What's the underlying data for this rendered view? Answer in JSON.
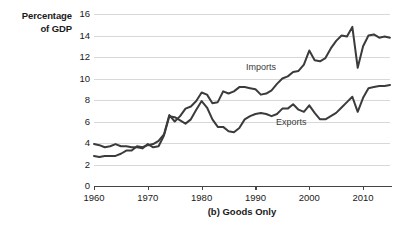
{
  "chart_data": {
    "type": "line",
    "title": "(b) Goods Only",
    "ylabel_line1": "Percentage",
    "ylabel_line2": "of GDP",
    "xlabel": "",
    "xlim": [
      1960,
      2015
    ],
    "ylim": [
      0,
      16
    ],
    "yticks": [
      0,
      2,
      4,
      6,
      8,
      10,
      12,
      14,
      16
    ],
    "xticks": [
      1960,
      1970,
      1980,
      1990,
      2000,
      2010
    ],
    "grid": true,
    "legend_position": "inline-annotation",
    "line_color": "#3b3b3b",
    "grid_color": "#d8d8d8",
    "x": [
      1960,
      1961,
      1962,
      1963,
      1964,
      1965,
      1966,
      1967,
      1968,
      1969,
      1970,
      1971,
      1972,
      1973,
      1974,
      1975,
      1976,
      1977,
      1978,
      1979,
      1980,
      1981,
      1982,
      1983,
      1984,
      1985,
      1986,
      1987,
      1988,
      1989,
      1990,
      1991,
      1992,
      1993,
      1994,
      1995,
      1996,
      1997,
      1998,
      1999,
      2000,
      2001,
      2002,
      2003,
      2004,
      2005,
      2006,
      2007,
      2008,
      2009,
      2010,
      2011,
      2012,
      2013,
      2014,
      2015
    ],
    "series": [
      {
        "name": "Imports",
        "label": "Imports",
        "values": [
          2.8,
          2.7,
          2.8,
          2.8,
          2.8,
          3.0,
          3.3,
          3.3,
          3.7,
          3.6,
          3.8,
          3.9,
          4.2,
          4.8,
          6.6,
          6.0,
          6.5,
          7.2,
          7.4,
          7.9,
          8.7,
          8.5,
          7.7,
          7.8,
          8.8,
          8.6,
          8.8,
          9.2,
          9.2,
          9.1,
          9.0,
          8.5,
          8.6,
          8.9,
          9.5,
          10.0,
          10.2,
          10.6,
          10.7,
          11.3,
          12.6,
          11.7,
          11.6,
          11.9,
          12.8,
          13.5,
          14.0,
          13.9,
          14.8,
          11.0,
          13.0,
          14.0,
          14.1,
          13.8,
          13.9,
          13.8
        ]
      },
      {
        "name": "Exports",
        "label": "Exports",
        "values": [
          3.9,
          3.8,
          3.6,
          3.7,
          3.9,
          3.7,
          3.7,
          3.6,
          3.6,
          3.5,
          3.9,
          3.6,
          3.7,
          4.7,
          6.5,
          6.4,
          6.1,
          5.8,
          6.2,
          7.1,
          7.9,
          7.3,
          6.2,
          5.5,
          5.5,
          5.1,
          5.0,
          5.4,
          6.2,
          6.5,
          6.7,
          6.8,
          6.7,
          6.5,
          6.7,
          7.2,
          7.2,
          7.6,
          7.1,
          6.9,
          7.5,
          6.8,
          6.2,
          6.2,
          6.5,
          6.8,
          7.3,
          7.8,
          8.3,
          6.9,
          8.2,
          9.1,
          9.2,
          9.3,
          9.3,
          9.4
        ]
      }
    ]
  }
}
